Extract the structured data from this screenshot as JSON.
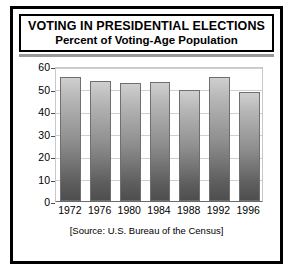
{
  "figure": {
    "title_main": "VOTING IN PRESIDENTIAL ELECTIONS",
    "title_sub": "Percent of Voting-Age Population",
    "source": "[Source: U.S. Bureau of the Census]"
  },
  "chart_data": {
    "type": "bar",
    "title": "VOTING IN PRESIDENTIAL ELECTIONS",
    "subtitle": "Percent of Voting-Age Population",
    "categories": [
      "1972",
      "1976",
      "1980",
      "1984",
      "1988",
      "1992",
      "1996"
    ],
    "values": [
      55,
      53.5,
      52.5,
      53,
      49.5,
      55,
      48.5
    ],
    "xlabel": "",
    "ylabel": "",
    "ylim": [
      0,
      60
    ],
    "yticks": [
      0,
      10,
      20,
      30,
      40,
      50,
      60
    ],
    "ytick_labels": [
      "0",
      "10",
      "20",
      "30",
      "40",
      "50",
      "60"
    ],
    "grid": true,
    "legend": false,
    "annotation": "[Source: U.S. Bureau of the Census]",
    "bar_color": "#8e8e8e",
    "bar_edge_color": "#6f6f6f",
    "grid_color": "#cfcfcf"
  }
}
